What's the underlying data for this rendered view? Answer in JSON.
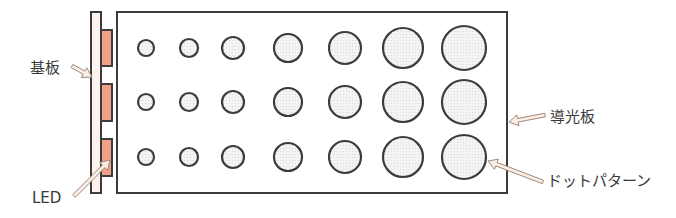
{
  "labels": {
    "substrate": "基板",
    "led": "LED",
    "light_guide": "導光板",
    "dot_pattern": "ドットパターン"
  },
  "colors": {
    "outline": "#3c3c3c",
    "substrate_fill": "#fdf3ee",
    "led_fill": "#f3a089",
    "dot_fill": "#f1f1f1",
    "arrow_fill": "#fbeee6",
    "arrow_stroke": "#a08878",
    "text": "#3a3a3a"
  },
  "substrate": {
    "x": 91,
    "y": 12,
    "w": 10,
    "h": 181
  },
  "leds": [
    {
      "x": 101,
      "y": 30,
      "w": 11,
      "h": 36
    },
    {
      "x": 101,
      "y": 84,
      "w": 11,
      "h": 37
    },
    {
      "x": 101,
      "y": 139,
      "w": 11,
      "h": 37
    }
  ],
  "light_guide": {
    "x": 117,
    "y": 12,
    "w": 390,
    "h": 181
  },
  "dot_columns": [
    {
      "cx": 146,
      "r": 8
    },
    {
      "cx": 189,
      "r": 9
    },
    {
      "cx": 233,
      "r": 11
    },
    {
      "cx": 288,
      "r": 14
    },
    {
      "cx": 345,
      "r": 16
    },
    {
      "cx": 403,
      "r": 20
    },
    {
      "cx": 464,
      "r": 22
    }
  ],
  "dot_rows": [
    48,
    102,
    157
  ],
  "arrows": [
    {
      "name": "substrate-arrow",
      "from": [
        72,
        66
      ],
      "to": [
        92,
        77
      ]
    },
    {
      "name": "led-arrow",
      "from": [
        74,
        196
      ],
      "to": [
        110,
        160
      ]
    },
    {
      "name": "light-guide-arrow",
      "from": [
        545,
        115
      ],
      "to": [
        509,
        122
      ]
    },
    {
      "name": "dot-pattern-arrow",
      "from": [
        543,
        182
      ],
      "to": [
        488,
        161
      ]
    }
  ],
  "label_positions": {
    "substrate": {
      "x": 30,
      "y": 61
    },
    "led": {
      "x": 32,
      "y": 191
    },
    "light_guide": {
      "x": 550,
      "y": 110
    },
    "dot_pattern": {
      "x": 547,
      "y": 174
    }
  }
}
